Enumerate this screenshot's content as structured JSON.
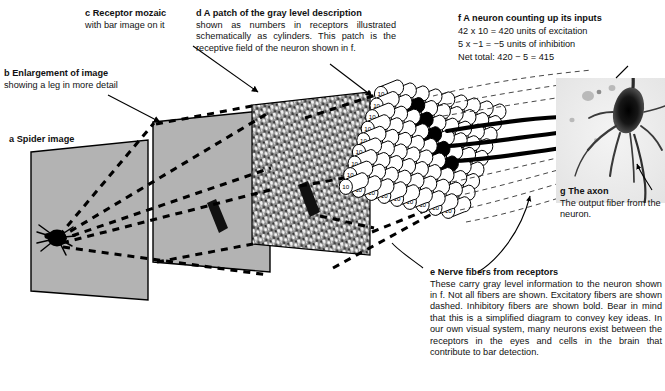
{
  "figure": {
    "background_color": "#ffffff",
    "ink_color": "#000000",
    "panel_fill": "#b3b3b3"
  },
  "captions": {
    "a": {
      "label": "a",
      "heading": "a Spider image",
      "body": ""
    },
    "b": {
      "label": "b",
      "heading": "b Enlargement of image",
      "body": "showing a leg in more detail"
    },
    "c": {
      "label": "c",
      "heading": "c Receptor mozaic",
      "body": "with bar image on it"
    },
    "d": {
      "label": "d",
      "heading": "d A patch of the gray level description",
      "body": "shown as numbers in receptors illustrated schematically as cylinders. This patch is the receptive field of the neuron shown in f."
    },
    "e": {
      "label": "e",
      "heading": "e Nerve fibers from receptors",
      "body": "These carry gray level information to the neuron shown in f. Not all fibers are shown. Excitatory fibers are shown dashed. Inhibitory fibers are shown bold. Bear in mind that this is a simplified diagram to convey key ideas. In our own visual system, many neurons exist between the receptors in the eyes and cells in the brain that contribute to bar detection."
    },
    "f": {
      "label": "f",
      "heading": "f A neuron counting up its inputs",
      "line1": "42 x 10 = 420 units of excitation",
      "line2": "5 x −1 = −5 units of inhibition",
      "line3": "Net total: 420 − 5 = 415"
    },
    "g": {
      "label": "g",
      "heading": "g The axon",
      "body": "The output fiber from the neuron."
    }
  },
  "receptor_array": {
    "excitatory_value": "10",
    "inhibitory_value": "1",
    "excitatory_count": 42,
    "inhibitory_count": 5,
    "excitatory_units": 420,
    "inhibitory_units": -5,
    "net_total": 415,
    "excitatory_fill": "#ffffff",
    "inhibitory_fill": "#000000"
  },
  "icons": {
    "spider": "spider-icon",
    "neuron": "neuron-photomicrograph",
    "bar": "black-bar-stimulus"
  }
}
